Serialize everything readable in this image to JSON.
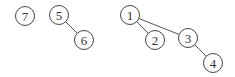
{
  "diagram": {
    "type": "forest",
    "nodes": [
      {
        "id": "7",
        "label": "7",
        "x": 25,
        "y": 16
      },
      {
        "id": "5",
        "label": "5",
        "x": 59,
        "y": 15
      },
      {
        "id": "6",
        "label": "6",
        "x": 84,
        "y": 40
      },
      {
        "id": "1",
        "label": "1",
        "x": 130,
        "y": 15
      },
      {
        "id": "2",
        "label": "2",
        "x": 155,
        "y": 40
      },
      {
        "id": "3",
        "label": "3",
        "x": 188,
        "y": 38
      },
      {
        "id": "4",
        "label": "4",
        "x": 213,
        "y": 63
      }
    ],
    "edges": [
      {
        "from": "5",
        "to": "6"
      },
      {
        "from": "1",
        "to": "2"
      },
      {
        "from": "1",
        "to": "3"
      },
      {
        "from": "3",
        "to": "4"
      }
    ],
    "node_radius": 9.5
  }
}
